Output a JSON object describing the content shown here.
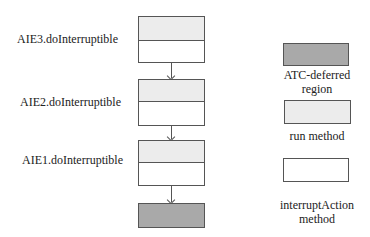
{
  "diagram": {
    "stack": [
      {
        "label": "AIE3.doInterruptible"
      },
      {
        "label": "AIE2.doInterruptible"
      },
      {
        "label": "AIE1.doInterruptible"
      }
    ],
    "colors": {
      "atc_deferred": "#a9a9a9",
      "run_method": "#ececec",
      "interrupt_action": "#ffffff",
      "border": "#555555"
    }
  },
  "legend": {
    "atc_deferred": "ATC-deferred region",
    "atc_deferred_line1": "ATC-deferred",
    "atc_deferred_line2": "region",
    "run_method": "run method",
    "interrupt_action_line1": "interruptAction",
    "interrupt_action_line2": "method"
  }
}
